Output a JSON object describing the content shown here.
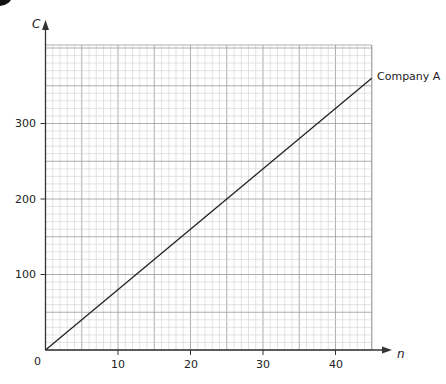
{
  "chart_data": {
    "type": "line",
    "title": "",
    "xlabel": "n",
    "ylabel": "C",
    "xlim": [
      0,
      45
    ],
    "ylim": [
      0,
      405
    ],
    "x_ticks": [
      0,
      10,
      20,
      30,
      40
    ],
    "y_ticks": [
      100,
      200,
      300
    ],
    "origin_label": "0",
    "grid": true,
    "series": [
      {
        "name": "Company A",
        "x": [
          0,
          45
        ],
        "values": [
          0,
          360
        ]
      }
    ],
    "annotations": [
      {
        "text": "Company A",
        "x": 45,
        "y": 360
      }
    ]
  },
  "labels": {
    "origin": "0",
    "x10": "10",
    "x20": "20",
    "x30": "30",
    "x40": "40",
    "y100": "100",
    "y200": "200",
    "y300": "300",
    "xaxis": "n",
    "yaxis": "C",
    "series_a": "Company A"
  }
}
